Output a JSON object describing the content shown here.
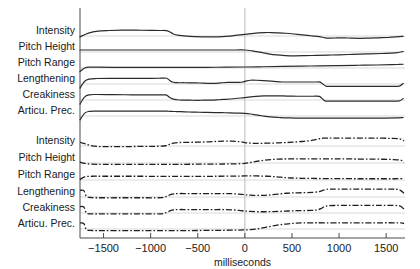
{
  "chart_data": {
    "type": "line",
    "title": "",
    "xlabel": "milliseconds",
    "ylabel": "",
    "xlim": [
      -1750,
      1700
    ],
    "xticks": [
      -1500,
      -1000,
      -500,
      0,
      500,
      1000,
      1500
    ],
    "xticklabels": [
      "−1500",
      "−1000",
      "−500",
      "0",
      "500",
      "1000",
      "1500"
    ],
    "grid": false,
    "legend": "none",
    "annotations": [
      "vertical reference line at 0 ms"
    ],
    "panels": [
      {
        "name": "upper-panel",
        "linestyle": "solid",
        "row_labels": [
          "Intensity",
          "Pitch Height",
          "Pitch Range",
          "Lengthening",
          "Creakiness",
          "Articu. Prec."
        ],
        "series": [
          {
            "name": "Intensity",
            "x": [
              -1750,
              -1660,
              -1560,
              -1440,
              -1300,
              -1150,
              -1000,
              -900,
              -820,
              -760,
              -700,
              -620,
              -520,
              -420,
              -330,
              -240,
              -160,
              -80,
              0,
              70,
              140,
              210,
              280,
              350,
              430,
              520,
              610,
              700,
              790,
              850,
              910,
              980,
              1060,
              1140,
              1230,
              1320,
              1420,
              1520,
              1610,
              1680
            ],
            "values": [
              0.3,
              0.56,
              0.7,
              0.74,
              0.76,
              0.76,
              0.75,
              0.74,
              0.72,
              0.5,
              0.4,
              0.35,
              0.32,
              0.3,
              0.3,
              0.32,
              0.36,
              0.42,
              0.48,
              0.53,
              0.58,
              0.6,
              0.6,
              0.58,
              0.55,
              0.5,
              0.44,
              0.38,
              0.32,
              0.24,
              0.22,
              0.23,
              0.24,
              0.21,
              0.2,
              0.22,
              0.24,
              0.26,
              0.3,
              0.34
            ]
          },
          {
            "name": "Pitch Height",
            "x": [
              -1750,
              -1500,
              -1200,
              -900,
              -600,
              -300,
              -100,
              0,
              80,
              160,
              250,
              340,
              430,
              520,
              640,
              760,
              880,
              1000,
              1150,
              1300,
              1450,
              1600,
              1680
            ],
            "values": [
              0.5,
              0.5,
              0.5,
              0.5,
              0.5,
              0.5,
              0.5,
              0.5,
              0.44,
              0.35,
              0.24,
              0.16,
              0.12,
              0.1,
              0.11,
              0.13,
              0.15,
              0.17,
              0.2,
              0.23,
              0.26,
              0.3,
              0.4
            ]
          },
          {
            "name": "Pitch Range",
            "x": [
              -1750,
              -1700,
              -1640,
              -1560,
              -1400,
              -1200,
              -1000,
              -800,
              -600,
              -400,
              -200,
              0,
              200,
              400,
              600,
              800,
              1000,
              1200,
              1400,
              1560,
              1640,
              1680
            ],
            "values": [
              0.12,
              0.36,
              0.42,
              0.42,
              0.41,
              0.41,
              0.4,
              0.4,
              0.4,
              0.41,
              0.42,
              0.43,
              0.45,
              0.47,
              0.49,
              0.51,
              0.53,
              0.55,
              0.57,
              0.59,
              0.61,
              0.62
            ]
          },
          {
            "name": "Lengthening",
            "x": [
              -1750,
              -1700,
              -1650,
              -1580,
              -1400,
              -1200,
              -1000,
              -900,
              -860,
              -830,
              -800,
              -770,
              -740,
              -700,
              -640,
              -560,
              -480,
              -400,
              -330,
              -280,
              -240,
              -180,
              -120,
              -60,
              -20,
              20,
              60,
              120,
              200,
              280,
              340,
              400,
              460,
              520,
              600,
              680,
              760,
              800,
              830,
              860,
              900,
              1000,
              1200,
              1400,
              1560,
              1640,
              1680
            ],
            "values": [
              0.08,
              0.55,
              0.7,
              0.74,
              0.75,
              0.75,
              0.75,
              0.76,
              0.77,
              0.76,
              0.62,
              0.5,
              0.46,
              0.45,
              0.45,
              0.44,
              0.43,
              0.41,
              0.4,
              0.42,
              0.45,
              0.47,
              0.47,
              0.47,
              0.5,
              0.58,
              0.62,
              0.62,
              0.6,
              0.56,
              0.52,
              0.5,
              0.5,
              0.5,
              0.5,
              0.5,
              0.5,
              0.49,
              0.35,
              0.22,
              0.2,
              0.2,
              0.2,
              0.2,
              0.2,
              0.22,
              0.4
            ]
          },
          {
            "name": "Creakiness",
            "x": [
              -1750,
              -1700,
              -1650,
              -1580,
              -1400,
              -1200,
              -1000,
              -900,
              -860,
              -830,
              -800,
              -760,
              -720,
              -660,
              -580,
              -500,
              -440,
              -380,
              -330,
              -280,
              -200,
              -120,
              -40,
              40,
              120,
              200,
              280,
              340,
              400,
              480,
              560,
              640,
              720,
              790,
              820,
              850,
              900,
              1000,
              1200,
              1400,
              1560,
              1640,
              1680
            ],
            "values": [
              0.08,
              0.58,
              0.72,
              0.74,
              0.73,
              0.72,
              0.71,
              0.71,
              0.71,
              0.7,
              0.55,
              0.42,
              0.38,
              0.36,
              0.35,
              0.34,
              0.35,
              0.36,
              0.36,
              0.38,
              0.41,
              0.45,
              0.5,
              0.56,
              0.61,
              0.64,
              0.65,
              0.65,
              0.64,
              0.63,
              0.62,
              0.62,
              0.62,
              0.61,
              0.46,
              0.3,
              0.28,
              0.28,
              0.28,
              0.28,
              0.28,
              0.3,
              0.46
            ]
          },
          {
            "name": "Articu. Prec.",
            "x": [
              -1750,
              -1700,
              -1650,
              -1580,
              -1400,
              -1200,
              -1000,
              -900,
              -850,
              -810,
              -780,
              -740,
              -700,
              -640,
              -560,
              -480,
              -400,
              -320,
              -240,
              -160,
              -80,
              0,
              60,
              120,
              180,
              240,
              300,
              360,
              420,
              480,
              560,
              640,
              740,
              840,
              940,
              1060,
              1200,
              1340,
              1480,
              1600,
              1680
            ],
            "values": [
              0.1,
              0.56,
              0.68,
              0.7,
              0.7,
              0.7,
              0.7,
              0.7,
              0.7,
              0.69,
              0.68,
              0.67,
              0.66,
              0.65,
              0.63,
              0.62,
              0.61,
              0.6,
              0.59,
              0.58,
              0.56,
              0.54,
              0.5,
              0.44,
              0.38,
              0.32,
              0.28,
              0.26,
              0.24,
              0.23,
              0.22,
              0.22,
              0.22,
              0.22,
              0.22,
              0.22,
              0.22,
              0.22,
              0.22,
              0.23,
              0.26
            ]
          }
        ]
      },
      {
        "name": "lower-panel",
        "linestyle": "dashdot",
        "row_labels": [
          "Intensity",
          "Pitch Height",
          "Pitch Range",
          "Lengthening",
          "Creakiness",
          "Articu. Prec."
        ],
        "series": [
          {
            "name": "Intensity",
            "x": [
              -1750,
              -1700,
              -1640,
              -1560,
              -1440,
              -1300,
              -1150,
              -1000,
              -900,
              -840,
              -800,
              -760,
              -700,
              -620,
              -540,
              -460,
              -380,
              -300,
              -220,
              -140,
              -60,
              0,
              60,
              120,
              200,
              280,
              360,
              440,
              520,
              600,
              680,
              740,
              790,
              830,
              880,
              960,
              1060,
              1180,
              1300,
              1420,
              1540,
              1640,
              1690
            ],
            "values": [
              0.62,
              0.52,
              0.4,
              0.33,
              0.32,
              0.32,
              0.33,
              0.34,
              0.35,
              0.38,
              0.48,
              0.56,
              0.6,
              0.61,
              0.62,
              0.63,
              0.65,
              0.68,
              0.7,
              0.7,
              0.66,
              0.6,
              0.56,
              0.54,
              0.55,
              0.56,
              0.58,
              0.6,
              0.63,
              0.67,
              0.72,
              0.78,
              0.86,
              0.9,
              0.9,
              0.9,
              0.9,
              0.9,
              0.9,
              0.9,
              0.89,
              0.86,
              0.72
            ]
          },
          {
            "name": "Pitch Height",
            "x": [
              -1750,
              -1700,
              -1620,
              -1500,
              -1300,
              -1100,
              -900,
              -700,
              -500,
              -300,
              -150,
              -40,
              40,
              120,
              200,
              280,
              360,
              440,
              540,
              660,
              800,
              960,
              1120,
              1300,
              1460,
              1580,
              1660,
              1690
            ],
            "values": [
              0.42,
              0.33,
              0.28,
              0.27,
              0.27,
              0.27,
              0.27,
              0.27,
              0.28,
              0.29,
              0.3,
              0.32,
              0.38,
              0.47,
              0.55,
              0.6,
              0.63,
              0.64,
              0.64,
              0.64,
              0.64,
              0.64,
              0.64,
              0.63,
              0.62,
              0.6,
              0.55,
              0.42
            ]
          },
          {
            "name": "Pitch Range",
            "x": [
              -1750,
              -1700,
              -1620,
              -1500,
              -1300,
              -1100,
              -900,
              -700,
              -500,
              -300,
              -120,
              0,
              120,
              240,
              340,
              420,
              500,
              600,
              720,
              860,
              1000,
              1160,
              1320,
              1480,
              1600,
              1690
            ],
            "values": [
              0.4,
              0.58,
              0.62,
              0.62,
              0.62,
              0.62,
              0.61,
              0.61,
              0.61,
              0.62,
              0.63,
              0.64,
              0.64,
              0.62,
              0.58,
              0.53,
              0.5,
              0.48,
              0.47,
              0.46,
              0.46,
              0.45,
              0.45,
              0.45,
              0.45,
              0.46
            ]
          },
          {
            "name": "Lengthening",
            "x": [
              -1750,
              -1710,
              -1680,
              -1620,
              -1500,
              -1300,
              -1100,
              -950,
              -880,
              -830,
              -790,
              -750,
              -700,
              -620,
              -540,
              -460,
              -380,
              -300,
              -220,
              -140,
              -60,
              0,
              60,
              140,
              220,
              300,
              380,
              440,
              500,
              560,
              640,
              720,
              780,
              820,
              860,
              900,
              1000,
              1200,
              1400,
              1560,
              1640,
              1690
            ],
            "values": [
              0.82,
              0.8,
              0.4,
              0.32,
              0.31,
              0.31,
              0.31,
              0.31,
              0.32,
              0.4,
              0.52,
              0.58,
              0.6,
              0.6,
              0.6,
              0.6,
              0.6,
              0.6,
              0.6,
              0.59,
              0.56,
              0.52,
              0.49,
              0.47,
              0.48,
              0.52,
              0.58,
              0.62,
              0.64,
              0.65,
              0.66,
              0.68,
              0.72,
              0.8,
              0.88,
              0.9,
              0.9,
              0.9,
              0.9,
              0.9,
              0.86,
              0.62
            ]
          },
          {
            "name": "Creakiness",
            "x": [
              -1750,
              -1710,
              -1680,
              -1620,
              -1500,
              -1300,
              -1100,
              -950,
              -880,
              -830,
              -790,
              -750,
              -700,
              -620,
              -540,
              -460,
              -380,
              -300,
              -220,
              -140,
              -60,
              0,
              60,
              140,
              220,
              300,
              380,
              460,
              540,
              620,
              700,
              760,
              800,
              840,
              880,
              960,
              1100,
              1280,
              1440,
              1580,
              1650,
              1690
            ],
            "values": [
              0.8,
              0.78,
              0.36,
              0.3,
              0.3,
              0.3,
              0.3,
              0.3,
              0.31,
              0.4,
              0.52,
              0.58,
              0.6,
              0.6,
              0.6,
              0.6,
              0.6,
              0.6,
              0.6,
              0.58,
              0.54,
              0.5,
              0.47,
              0.45,
              0.45,
              0.46,
              0.48,
              0.5,
              0.52,
              0.53,
              0.54,
              0.56,
              0.64,
              0.78,
              0.86,
              0.88,
              0.88,
              0.88,
              0.88,
              0.88,
              0.84,
              0.62
            ]
          },
          {
            "name": "Articu. Prec.",
            "x": [
              -1750,
              -1710,
              -1680,
              -1620,
              -1500,
              -1300,
              -1100,
              -900,
              -700,
              -500,
              -300,
              -160,
              -60,
              0,
              60,
              140,
              220,
              300,
              380,
              460,
              540,
              620,
              720,
              840,
              980,
              1120,
              1280,
              1440,
              1580,
              1660,
              1690
            ],
            "values": [
              0.78,
              0.74,
              0.32,
              0.26,
              0.25,
              0.25,
              0.25,
              0.25,
              0.25,
              0.26,
              0.27,
              0.28,
              0.29,
              0.3,
              0.32,
              0.38,
              0.48,
              0.58,
              0.66,
              0.72,
              0.76,
              0.78,
              0.79,
              0.79,
              0.79,
              0.79,
              0.79,
              0.79,
              0.79,
              0.78,
              0.74
            ]
          }
        ]
      }
    ]
  },
  "colors": {
    "curve": "#2b2b2b",
    "axis": "#4a4a4a",
    "baseline": "#d9d9d9",
    "zero_line": "#b9b9b9",
    "background": "#ffffff"
  }
}
